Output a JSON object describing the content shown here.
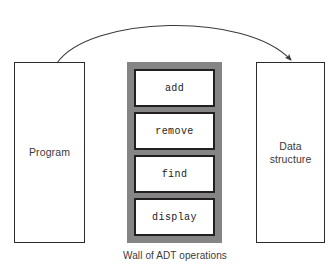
{
  "diagram": {
    "background_color": "#ffffff",
    "wall_color": "#858585",
    "box_border_color": "#231f20",
    "entity_border_color": "#2b2b2b",
    "arrow_color": "#3a3a3a"
  },
  "program": {
    "label": "Program"
  },
  "data_structure": {
    "label": "Data\nstructure"
  },
  "wall": {
    "caption": "Wall of ADT operations",
    "operations": [
      {
        "label": "add"
      },
      {
        "label": "remove"
      },
      {
        "label": "find"
      },
      {
        "label": "display"
      }
    ]
  },
  "arrow": {
    "name": "curved-arrow",
    "from": "Program",
    "to": "Data structure",
    "direction": "left-to-right"
  }
}
